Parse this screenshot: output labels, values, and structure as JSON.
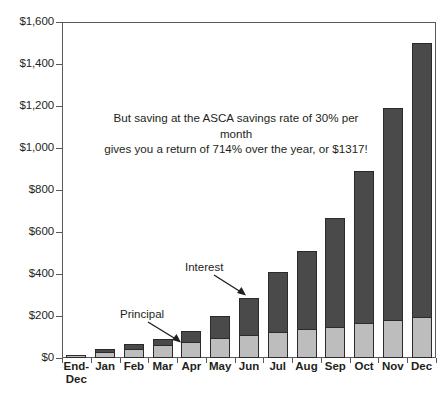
{
  "chart_data": {
    "type": "bar",
    "subtype": "stacked-bar",
    "title": "",
    "xlabel": "",
    "ylabel": "",
    "ylim": [
      0,
      1600
    ],
    "y_ticks": [
      "$0",
      "$200",
      "$400",
      "$600",
      "$800",
      "$1,000",
      "$1,200",
      "$1,400",
      "$1,600"
    ],
    "y_tick_values": [
      0,
      200,
      400,
      600,
      800,
      1000,
      1200,
      1400,
      1600
    ],
    "grid": false,
    "legend": "none (inline callout labels)",
    "categories": [
      "End-\nDec",
      "Jan",
      "Feb",
      "Mar",
      "Apr",
      "May",
      "Jun",
      "Jul",
      "Aug",
      "Sep",
      "Oct",
      "Nov",
      "Dec"
    ],
    "series": [
      {
        "name": "Principal",
        "color": "#bdbdbd",
        "values": [
          15,
          30,
          45,
          60,
          75,
          95,
          110,
          125,
          140,
          150,
          165,
          180,
          195
        ]
      },
      {
        "name": "Interest",
        "color": "#4a4a4a",
        "values": [
          0,
          12,
          20,
          32,
          55,
          105,
          175,
          285,
          370,
          515,
          725,
          1010,
          1305
        ]
      }
    ],
    "totals": [
      15,
      42,
      65,
      92,
      130,
      200,
      285,
      410,
      510,
      665,
      890,
      1190,
      1500
    ],
    "annotations": [
      {
        "name": "savings-rate-note",
        "line1": "But saving at the ASCA savings rate of 30% per month",
        "line2": "gives you a return of 714% over the year, or $1317!"
      },
      {
        "name": "principal-callout",
        "label": "Principal"
      },
      {
        "name": "interest-callout",
        "label": "Interest"
      }
    ],
    "colors": {
      "principal": "#bdbdbd",
      "interest": "#4a4a4a",
      "axis": "#58595b",
      "text": "#231f20",
      "background": "#ffffff"
    }
  }
}
